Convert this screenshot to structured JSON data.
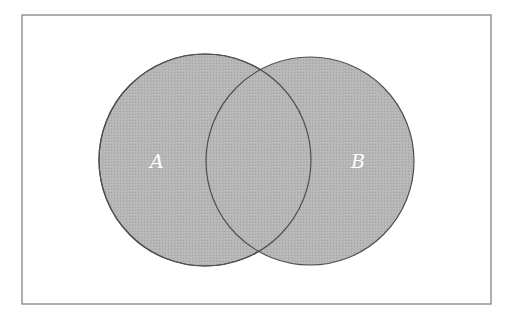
{
  "diagram": {
    "type": "venn",
    "universe": {
      "x": 22,
      "y": 15,
      "width": 469,
      "height": 289,
      "stroke": "#7a7a7a"
    },
    "fill_color": "#b4b4b4",
    "stroke_color": "#505050",
    "sets": [
      {
        "label": "A",
        "cx": 205,
        "cy": 160,
        "r": 106,
        "label_x": 157,
        "label_y": 168
      },
      {
        "label": "B",
        "cx": 310,
        "cy": 161,
        "r": 104,
        "label_x": 358,
        "label_y": 168
      }
    ]
  }
}
